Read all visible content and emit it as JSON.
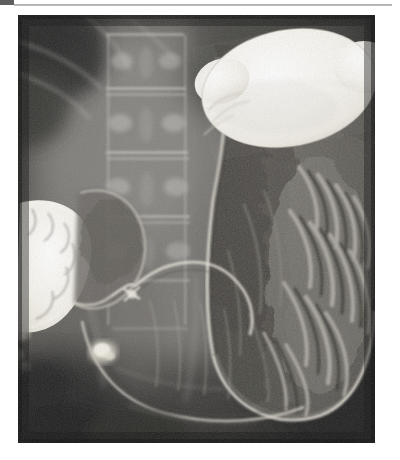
{
  "document": {
    "page_background": "#ffffff",
    "rule_color": "#a8a8a8",
    "corner_mark_color": "#5e5e5e",
    "caption": ""
  },
  "figure": {
    "kind": "radiograph",
    "modality": "Double-contrast upper gastrointestinal barium study",
    "projection": "Supine anteroposterior abdomen",
    "frame": {
      "x": 18,
      "y": 15,
      "width": 357,
      "height": 428
    },
    "film_base_color": "#2b2b2b",
    "bone_color": "#b8b6b1",
    "barium_color": "#f4f2ec",
    "mucosa_color": "#8f8c86",
    "gas_color": "#3a3a3a",
    "regions": [
      {
        "name": "gastric-fundus-barium-pool",
        "label": "Barium pool in gastric fundus",
        "density": "high",
        "color": "#f6f4ee",
        "cx": 289,
        "cy": 88,
        "rx": 86,
        "ry": 57,
        "rotation": -12
      },
      {
        "name": "duodenal-barium-column",
        "label": "Barium-filled duodenal bulb and descending duodenum",
        "density": "high",
        "color": "#f4f2ec",
        "cx": 48,
        "cy": 250,
        "rx": 28,
        "ry": 48,
        "rotation": 18
      },
      {
        "name": "antral-barium-fleck",
        "label": "Residual barium fleck in antrum",
        "density": "high",
        "color": "#ded9d0",
        "cx": 103,
        "cy": 352,
        "rx": 13,
        "ry": 11,
        "rotation": 0
      },
      {
        "name": "gastric-body-gas",
        "label": "Gas-distended gastric body",
        "density": "low",
        "color": "#3d3d3d"
      },
      {
        "name": "rugal-folds",
        "label": "Rugal folds along greater curvature",
        "density": "medium",
        "color": "#9a968f"
      },
      {
        "name": "lumbar-spine",
        "label": "Lumbar vertebral bodies",
        "density": "medium",
        "color": "#b0aea9"
      },
      {
        "name": "duodenal-cap",
        "label": "Duodenal cap",
        "density": "medium",
        "color": "#7e7a74"
      },
      {
        "name": "greater-curvature",
        "label": "Greater curvature border",
        "density": "medium",
        "color": "#cfcbc3"
      },
      {
        "name": "lesser-curvature",
        "label": "Lesser curvature border",
        "density": "medium",
        "color": "#c6c2ba"
      },
      {
        "name": "pyloric-channel",
        "label": "Pyloric channel",
        "density": "medium",
        "color": "#d6d2c9"
      }
    ]
  }
}
